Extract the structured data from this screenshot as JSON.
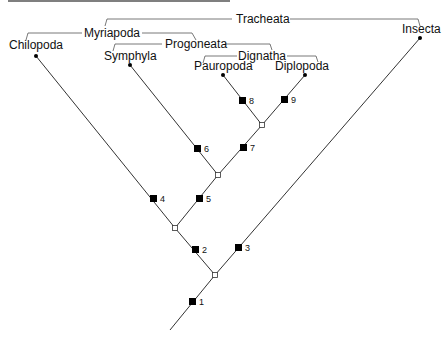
{
  "groups": {
    "tracheata": "Tracheata",
    "myriapoda": "Myriapoda",
    "progoneata": "Progoneata",
    "dignatha": "Dignatha"
  },
  "taxa": {
    "chilopoda": "Chilopoda",
    "symphyla": "Symphyla",
    "pauropoda": "Pauropoda",
    "diplopoda": "Diplopoda",
    "insecta": "Insecta"
  },
  "characters": {
    "c1": "1",
    "c2": "2",
    "c3": "3",
    "c4": "4",
    "c5": "5",
    "c6": "6",
    "c7": "7",
    "c8": "8",
    "c9": "9"
  },
  "colors": {
    "line": "#333333",
    "marker": "#000000",
    "background": "#ffffff"
  }
}
